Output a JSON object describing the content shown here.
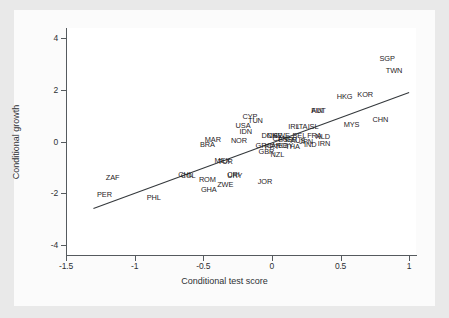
{
  "chart_data": {
    "type": "scatter",
    "title": "",
    "xlabel": "Conditional test score",
    "ylabel": "Conditional growth",
    "xlim": [
      -1.5,
      1.05
    ],
    "ylim": [
      -4.4,
      4.4
    ],
    "xticks": [
      "-1.5",
      "-1",
      "-0.5",
      "0",
      "0.5",
      "1"
    ],
    "xtickvals": [
      -1.5,
      -1,
      -0.5,
      0,
      0.5,
      1
    ],
    "yticks": [
      "4",
      "2",
      "0",
      "-2",
      "-4"
    ],
    "ytickvals": [
      4,
      2,
      0,
      -2,
      -4
    ],
    "grid": false,
    "legend": "none",
    "marker_style": "text-label-only",
    "fit_line": {
      "label": "linear fit",
      "x0": -1.3,
      "y0": -2.6,
      "x1": 1.0,
      "y1": 1.9
    },
    "points": [
      {
        "label": "SGP",
        "x": 0.84,
        "y": 3.22
      },
      {
        "label": "TWN",
        "x": 0.89,
        "y": 2.77
      },
      {
        "label": "HKG",
        "x": 0.53,
        "y": 1.78
      },
      {
        "label": "KOR",
        "x": 0.68,
        "y": 1.83
      },
      {
        "label": "CHN",
        "x": 0.79,
        "y": 0.86
      },
      {
        "label": "MYS",
        "x": 0.58,
        "y": 0.66
      },
      {
        "label": "FIN",
        "x": 0.33,
        "y": 1.22
      },
      {
        "label": "AUT",
        "x": 0.34,
        "y": 1.22
      },
      {
        "label": "ISL",
        "x": 0.3,
        "y": 0.62
      },
      {
        "label": "IRL",
        "x": 0.16,
        "y": 0.6
      },
      {
        "label": "ITA",
        "x": 0.22,
        "y": 0.6
      },
      {
        "label": "CYP",
        "x": -0.16,
        "y": 0.98
      },
      {
        "label": "TUN",
        "x": -0.12,
        "y": 0.83
      },
      {
        "label": "USA",
        "x": -0.21,
        "y": 0.65
      },
      {
        "label": "IDN",
        "x": -0.19,
        "y": 0.4
      },
      {
        "label": "NOR",
        "x": -0.24,
        "y": 0.05
      },
      {
        "label": "MAR",
        "x": -0.43,
        "y": 0.1
      },
      {
        "label": "BRA",
        "x": -0.47,
        "y": -0.1
      },
      {
        "label": "DNK",
        "x": -0.02,
        "y": 0.27
      },
      {
        "label": "CHE",
        "x": 0.02,
        "y": 0.27
      },
      {
        "label": "SWE",
        "x": 0.07,
        "y": 0.24
      },
      {
        "label": "BEL",
        "x": 0.2,
        "y": 0.26
      },
      {
        "label": "FRA",
        "x": 0.31,
        "y": 0.26
      },
      {
        "label": "NLD",
        "x": 0.37,
        "y": 0.22
      },
      {
        "label": "CAN",
        "x": 0.06,
        "y": 0.12
      },
      {
        "label": "ESP",
        "x": 0.1,
        "y": 0.1
      },
      {
        "label": "ISR",
        "x": 0.14,
        "y": 0.08
      },
      {
        "label": "AUS",
        "x": 0.19,
        "y": 0.05
      },
      {
        "label": "JPN",
        "x": 0.25,
        "y": 0.02
      },
      {
        "label": "IND",
        "x": 0.28,
        "y": -0.1
      },
      {
        "label": "IRN",
        "x": 0.38,
        "y": -0.07
      },
      {
        "label": "GRC",
        "x": -0.06,
        "y": -0.14
      },
      {
        "label": "PRT",
        "x": 0.0,
        "y": -0.16
      },
      {
        "label": "ARG",
        "x": 0.05,
        "y": -0.14
      },
      {
        "label": "EGY",
        "x": 0.1,
        "y": -0.14
      },
      {
        "label": "THA",
        "x": 0.15,
        "y": -0.16
      },
      {
        "label": "GBR",
        "x": -0.04,
        "y": -0.38
      },
      {
        "label": "NZL",
        "x": 0.04,
        "y": -0.48
      },
      {
        "label": "MEX",
        "x": -0.36,
        "y": -0.7
      },
      {
        "label": "TUR",
        "x": -0.34,
        "y": -0.74
      },
      {
        "label": "CHL",
        "x": -0.63,
        "y": -1.27
      },
      {
        "label": "COL",
        "x": -0.61,
        "y": -1.31
      },
      {
        "label": "CRI",
        "x": -0.28,
        "y": -1.27
      },
      {
        "label": "URY",
        "x": -0.27,
        "y": -1.31
      },
      {
        "label": "ROM",
        "x": -0.47,
        "y": -1.45
      },
      {
        "label": "ZWE",
        "x": -0.34,
        "y": -1.65
      },
      {
        "label": "GHA",
        "x": -0.46,
        "y": -1.85
      },
      {
        "label": "JOR",
        "x": -0.05,
        "y": -1.52
      },
      {
        "label": "ZAF",
        "x": -1.16,
        "y": -1.38
      },
      {
        "label": "PER",
        "x": -1.22,
        "y": -2.02
      },
      {
        "label": "PHL",
        "x": -0.86,
        "y": -2.15
      }
    ]
  }
}
